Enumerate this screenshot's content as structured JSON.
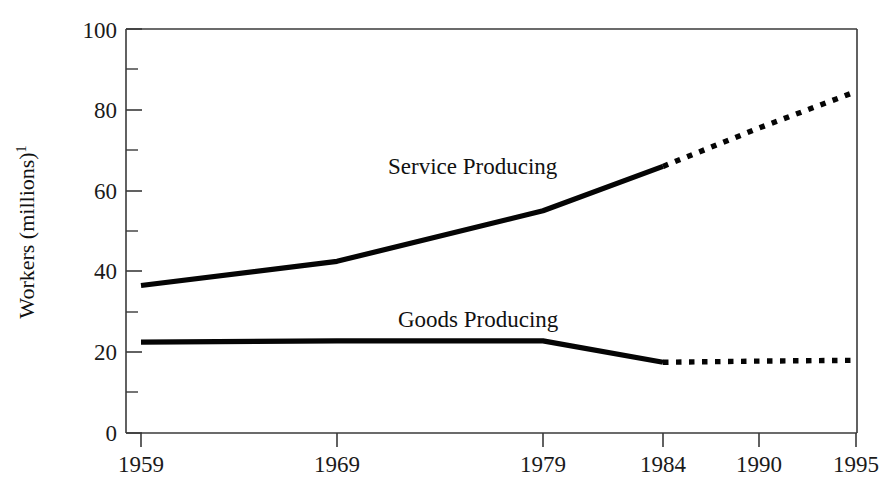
{
  "chart_data": {
    "type": "line",
    "title": "",
    "subtitle": "",
    "xlabel": "",
    "ylabel": "Workers (millions)",
    "ylabel_superscript": "1",
    "xlim": [
      1959,
      1995
    ],
    "ylim": [
      0,
      100
    ],
    "grid": false,
    "legend": "inline-annotations",
    "y_ticks_major": [
      0,
      20,
      40,
      60,
      80,
      100
    ],
    "y_ticks_minor": [
      10,
      30,
      50,
      70,
      90
    ],
    "x_ticks": [
      1959,
      1969,
      1979,
      1984,
      1990,
      1995
    ],
    "x_tick_labels": [
      "1959",
      "1969",
      "1979",
      "1984",
      "1990",
      "1995"
    ],
    "y_tick_labels": [
      "0",
      "20",
      "40",
      "60",
      "80",
      "100"
    ],
    "projection_start_year": 1984,
    "series": [
      {
        "name": "Service Producing",
        "label": "Service Producing",
        "style": "solid-then-dotted",
        "color": "#050505",
        "x": [
          1959,
          1969,
          1979,
          1984,
          1990,
          1995
        ],
        "values": [
          36.5,
          42.5,
          55,
          66,
          75.5,
          84.5
        ],
        "actual_x": [
          1959,
          1969,
          1979,
          1984
        ],
        "actual_values": [
          36.5,
          42.5,
          55,
          66
        ],
        "projected_x": [
          1984,
          1990,
          1995
        ],
        "projected_values": [
          66,
          75.5,
          84.5
        ]
      },
      {
        "name": "Goods Producing",
        "label": "Goods Producing",
        "style": "solid-then-dotted",
        "color": "#050505",
        "x": [
          1959,
          1969,
          1979,
          1984,
          1990,
          1995
        ],
        "values": [
          22.5,
          22.8,
          22.8,
          17.5,
          17.8,
          18
        ],
        "actual_x": [
          1959,
          1969,
          1979,
          1984
        ],
        "actual_values": [
          22.5,
          22.8,
          22.8,
          17.5
        ],
        "projected_x": [
          1984,
          1990,
          1995
        ],
        "projected_values": [
          17.5,
          17.8,
          18
        ]
      }
    ],
    "annotations": [
      {
        "text": "Service Producing",
        "x": 1969.5,
        "y": 70
      },
      {
        "text": "Goods Producing",
        "x": 1970,
        "y": 29
      }
    ]
  }
}
